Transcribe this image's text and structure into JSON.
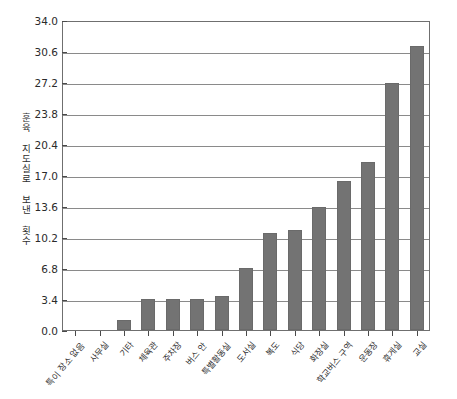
{
  "chart_data": {
    "type": "bar",
    "title": "",
    "xlabel": "",
    "ylabel": "훈육 지도실로 보낸 횟수",
    "ylim": [
      0.0,
      34.0
    ],
    "ytick_step": 3.4,
    "ytick_labels": [
      "0.0",
      "3.4",
      "6.8",
      "10.2",
      "13.6",
      "17.0",
      "20.4",
      "23.8",
      "27.2",
      "30.6",
      "34.0"
    ],
    "ytick_values": [
      0.0,
      3.4,
      6.8,
      10.2,
      13.6,
      17.0,
      20.4,
      23.8,
      27.2,
      30.6,
      34.0
    ],
    "grid": true,
    "legend": "none",
    "bar_color": "#737373",
    "categories": [
      "특이 장소 없음",
      "사무실",
      "기타",
      "체육관",
      "주차장",
      "버스 안",
      "특별활동실",
      "도서실",
      "복도",
      "식당",
      "화장실",
      "학교버스 구역",
      "운동장",
      "휴게실",
      "교실"
    ],
    "values": [
      0.0,
      0.0,
      1.1,
      3.4,
      3.4,
      3.4,
      3.8,
      6.8,
      10.7,
      11.0,
      13.6,
      16.5,
      18.5,
      27.3,
      31.3
    ]
  },
  "axis_colors": {
    "frame": "#6f6f6f",
    "grid": "#8a8a8a",
    "tick": "#4a4a4a",
    "text": "#2e2e2e"
  }
}
